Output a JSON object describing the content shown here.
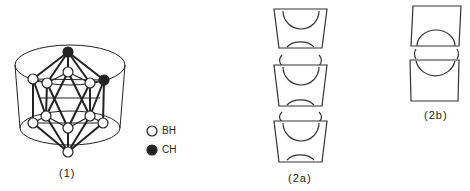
{
  "figure": {
    "structure_1": {
      "label": "(1)"
    },
    "legend": {
      "items": [
        {
          "symbol": "open-circle",
          "text": "BH"
        },
        {
          "symbol": "filled-circle",
          "text": "CH"
        }
      ]
    },
    "structure_2a": {
      "label": "(2a)"
    },
    "structure_2b": {
      "label": "(2b)"
    }
  },
  "colors": {
    "stroke": "#222222",
    "fill_ch": "#222222",
    "fill_bh": "#ffffff",
    "background": "#ffffff"
  }
}
